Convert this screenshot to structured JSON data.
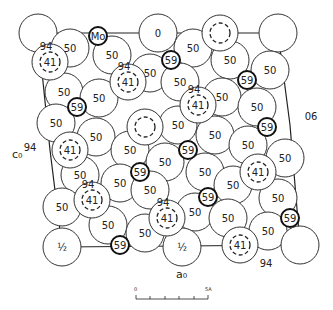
{
  "diagram": {
    "axis_labels": {
      "c": "c₀",
      "a": "a₀"
    },
    "edge_labels": [
      {
        "text": "94",
        "x": 30,
        "y": 147
      },
      {
        "text": "06",
        "x": 311,
        "y": 116
      },
      {
        "text": "94",
        "x": 266,
        "y": 263
      }
    ],
    "scale_bar": {
      "start": "0",
      "end": "5A"
    },
    "large_atoms": [
      {
        "x": 38,
        "y": 33,
        "label": ""
      },
      {
        "x": 158,
        "y": 33,
        "label": "0"
      },
      {
        "x": 278,
        "y": 33,
        "label": ""
      },
      {
        "x": 70,
        "y": 48,
        "label": "50"
      },
      {
        "x": 112,
        "y": 55,
        "label": "50"
      },
      {
        "x": 193,
        "y": 48,
        "label": "50"
      },
      {
        "x": 230,
        "y": 60,
        "label": "50"
      },
      {
        "x": 270,
        "y": 70,
        "label": "50"
      },
      {
        "x": 150,
        "y": 73,
        "label": "50"
      },
      {
        "x": 180,
        "y": 82,
        "label": "50"
      },
      {
        "x": 222,
        "y": 97,
        "label": "50"
      },
      {
        "x": 64,
        "y": 92,
        "label": "50"
      },
      {
        "x": 99,
        "y": 98,
        "label": "50"
      },
      {
        "x": 257,
        "y": 107,
        "label": "50"
      },
      {
        "x": 56,
        "y": 123,
        "label": "50"
      },
      {
        "x": 96,
        "y": 137,
        "label": "50"
      },
      {
        "x": 178,
        "y": 125,
        "label": "50"
      },
      {
        "x": 215,
        "y": 135,
        "label": "50"
      },
      {
        "x": 130,
        "y": 150,
        "label": "50"
      },
      {
        "x": 165,
        "y": 162,
        "label": "50"
      },
      {
        "x": 248,
        "y": 145,
        "label": "50"
      },
      {
        "x": 285,
        "y": 158,
        "label": "50"
      },
      {
        "x": 80,
        "y": 175,
        "label": "50"
      },
      {
        "x": 120,
        "y": 183,
        "label": "50"
      },
      {
        "x": 205,
        "y": 172,
        "label": "50"
      },
      {
        "x": 233,
        "y": 185,
        "label": "50"
      },
      {
        "x": 278,
        "y": 198,
        "label": "50"
      },
      {
        "x": 62,
        "y": 207,
        "label": "50"
      },
      {
        "x": 150,
        "y": 190,
        "label": "50"
      },
      {
        "x": 195,
        "y": 212,
        "label": "50"
      },
      {
        "x": 228,
        "y": 218,
        "label": "50"
      },
      {
        "x": 108,
        "y": 225,
        "label": "50"
      },
      {
        "x": 145,
        "y": 233,
        "label": "50"
      },
      {
        "x": 268,
        "y": 231,
        "label": "50"
      },
      {
        "x": 62,
        "y": 247,
        "label": "½"
      },
      {
        "x": 182,
        "y": 247,
        "label": "½"
      },
      {
        "x": 300,
        "y": 245,
        "label": ""
      }
    ],
    "dashed_atoms": [
      {
        "x": 220,
        "y": 33,
        "label": ""
      },
      {
        "x": 50,
        "y": 62,
        "label": "41",
        "note": "94"
      },
      {
        "x": 128,
        "y": 82,
        "label": "41",
        "note": "94"
      },
      {
        "x": 198,
        "y": 105,
        "label": "41",
        "note": "94"
      },
      {
        "x": 145,
        "y": 127,
        "label": ""
      },
      {
        "x": 70,
        "y": 150,
        "label": "41"
      },
      {
        "x": 258,
        "y": 172,
        "label": "41"
      },
      {
        "x": 92,
        "y": 200,
        "label": "41",
        "note": "94"
      },
      {
        "x": 167,
        "y": 218,
        "label": "41",
        "note": "94"
      },
      {
        "x": 240,
        "y": 245,
        "label": "41"
      }
    ],
    "small_atoms": [
      {
        "x": 98,
        "y": 36,
        "label": "Mo"
      },
      {
        "x": 171,
        "y": 60,
        "label": "59"
      },
      {
        "x": 247,
        "y": 80,
        "label": "59"
      },
      {
        "x": 77,
        "y": 107,
        "label": "59"
      },
      {
        "x": 267,
        "y": 127,
        "label": "59"
      },
      {
        "x": 188,
        "y": 150,
        "label": "59"
      },
      {
        "x": 140,
        "y": 172,
        "label": "59"
      },
      {
        "x": 208,
        "y": 197,
        "label": "59"
      },
      {
        "x": 290,
        "y": 218,
        "label": "59"
      },
      {
        "x": 120,
        "y": 245,
        "label": "59"
      }
    ]
  }
}
